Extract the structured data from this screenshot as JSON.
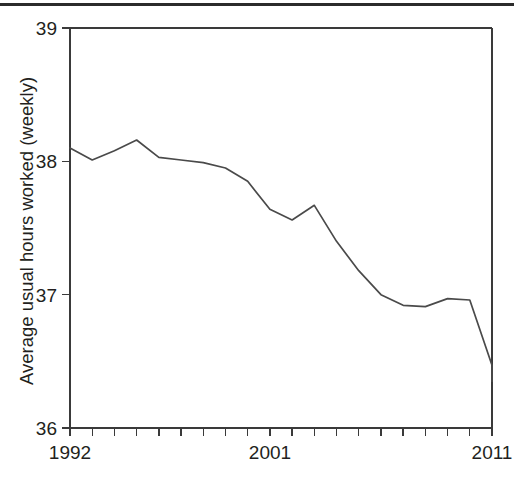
{
  "figure": {
    "has_top_rule": true,
    "background_color": "#ffffff",
    "line_color": "#4a4a4a",
    "axis_color": "#3a3a3a",
    "text_color": "#231f20"
  },
  "chart_data": {
    "type": "line",
    "title": "",
    "xlabel": "",
    "ylabel": "Average usual hours worked (weekly)",
    "xlim": [
      1992,
      2011
    ],
    "ylim": [
      36,
      39
    ],
    "grid": false,
    "legend": "none",
    "y_ticks": [
      "36",
      "37",
      "38",
      "39"
    ],
    "y_tick_values": [
      36,
      37,
      38,
      39
    ],
    "x_ticks_labeled": [
      "1992",
      "2001",
      "2011"
    ],
    "x_tick_values_labeled": [
      1992,
      2001,
      2011
    ],
    "x_tick_count": 20,
    "x": [
      1992,
      1993,
      1994,
      1995,
      1996,
      1997,
      1998,
      1999,
      2000,
      2001,
      2002,
      2003,
      2004,
      2005,
      2006,
      2007,
      2008,
      2009,
      2010,
      2011
    ],
    "values": [
      38.1,
      38.01,
      38.08,
      38.16,
      38.03,
      38.01,
      37.99,
      37.95,
      37.85,
      37.64,
      37.56,
      37.67,
      37.4,
      37.18,
      37.0,
      36.92,
      36.91,
      36.97,
      36.96,
      36.47
    ],
    "series": [
      {
        "name": "Average usual hours worked (weekly)",
        "values": [
          38.1,
          38.01,
          38.08,
          38.16,
          38.03,
          38.01,
          37.99,
          37.95,
          37.85,
          37.64,
          37.56,
          37.67,
          37.4,
          37.18,
          37.0,
          36.92,
          36.91,
          36.97,
          36.96,
          36.47
        ]
      }
    ],
    "final_point": {
      "x": 2011,
      "y": 36.35
    }
  },
  "caption": {
    "sliver_text": ""
  }
}
